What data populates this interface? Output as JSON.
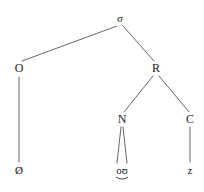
{
  "figure": {
    "type": "syllable-structure-tree",
    "background_color": "#ffffff",
    "line_color": "#555555",
    "text_color": "#1a1a1a"
  },
  "nodes": {
    "sigma": {
      "label": "σ",
      "name": "syllable",
      "x": 120,
      "y": 18
    },
    "onset": {
      "label": "O",
      "name": "onset",
      "x": 19,
      "y": 68
    },
    "rhyme": {
      "label": "R",
      "name": "rhyme",
      "x": 156,
      "y": 68
    },
    "nucleus": {
      "label": "N",
      "name": "nucleus",
      "x": 122,
      "y": 119
    },
    "coda": {
      "label": "C",
      "name": "coda",
      "x": 190,
      "y": 119
    },
    "onset_leaf": {
      "label": "Ø",
      "name": "null-onset-segment",
      "x": 19,
      "y": 170
    },
    "nucleus_leaf": {
      "label": "oʊ",
      "name": "diphthong-segment",
      "x": 122,
      "y": 170
    },
    "coda_leaf": {
      "label": "z",
      "name": "coda-segment",
      "x": 190,
      "y": 170
    }
  },
  "edges": [
    {
      "from": "sigma",
      "to": "onset",
      "x1": 117,
      "y1": 26,
      "x2": 22,
      "y2": 61
    },
    {
      "from": "sigma",
      "to": "rhyme",
      "x1": 123,
      "y1": 26,
      "x2": 154,
      "y2": 61
    },
    {
      "from": "rhyme",
      "to": "nucleus",
      "x1": 153,
      "y1": 76,
      "x2": 124,
      "y2": 112
    },
    {
      "from": "rhyme",
      "to": "coda",
      "x1": 159,
      "y1": 76,
      "x2": 189,
      "y2": 112
    },
    {
      "from": "onset",
      "to": "onset_leaf",
      "x1": 19,
      "y1": 77,
      "x2": 19,
      "y2": 162
    },
    {
      "from": "nucleus",
      "to": "nucleus_leaf_o",
      "x1": 121,
      "y1": 127,
      "x2": 117,
      "y2": 163
    },
    {
      "from": "nucleus",
      "to": "nucleus_leaf_u",
      "x1": 123,
      "y1": 127,
      "x2": 127,
      "y2": 163
    },
    {
      "from": "coda",
      "to": "coda_leaf",
      "x1": 190,
      "y1": 127,
      "x2": 190,
      "y2": 162
    }
  ]
}
